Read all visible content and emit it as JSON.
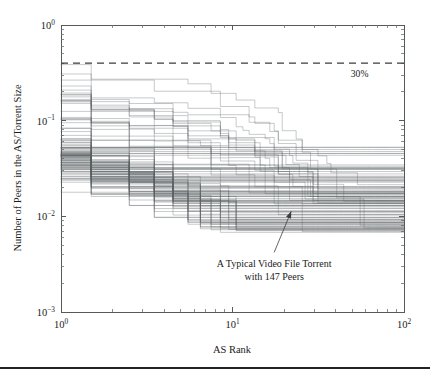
{
  "figure": {
    "title": "",
    "background_color": "#ffffff",
    "line_color": "#5d6166",
    "text_color": "#1a1a1a",
    "footer_rule": {
      "y": 367,
      "color": "#202428"
    }
  },
  "chart_data": {
    "type": "line",
    "title": "",
    "subtitle": "",
    "xlabel": "AS Rank",
    "ylabel": "Number of Peers in the AS/Torrent Size",
    "xscale": "log",
    "yscale": "log",
    "xlim": [
      1,
      100
    ],
    "ylim": [
      0.001,
      1
    ],
    "grid": false,
    "legend": "none",
    "x_tick_labels": [
      "10^0",
      "10^1",
      "10^2"
    ],
    "x_tick_values": [
      1,
      10,
      100
    ],
    "y_tick_labels": [
      "10^0",
      "10^-1",
      "10^-2",
      "10^-3"
    ],
    "y_tick_values": [
      1,
      0.1,
      0.01,
      0.001
    ],
    "annotations": [
      {
        "name": "typical-torrent-annotation",
        "text_line_1": "A Typical Video File Torrent",
        "text_line_2": "with 147 Peers",
        "arrow_from_x": 17.5,
        "arrow_from_y": 0.0042,
        "arrow_to_x": 22.0,
        "arrow_to_y": 0.0113
      },
      {
        "name": "threshold-label",
        "text": "30%",
        "x": 62,
        "y": 0.285
      }
    ],
    "reference_lines": [
      {
        "name": "thirty-percent-line",
        "orientation": "horizontal",
        "value": 0.4,
        "style": "dashed",
        "label": "30%"
      }
    ],
    "series_count": 104,
    "series_description": "Each curve is one BitTorrent torrent: fraction of that torrent's peers located in the AS ranked k, sorted in decreasing order of AS size.",
    "series_summary": {
      "x": [
        1,
        2,
        3,
        4,
        5,
        7,
        10,
        15,
        20,
        30,
        50,
        70,
        100
      ],
      "median_values": [
        0.072,
        0.05,
        0.04,
        0.033,
        0.028,
        0.022,
        0.017,
        0.0135,
        0.0118,
        0.0098,
        0.0083,
        0.0078,
        0.0075
      ],
      "upper_envelope": [
        0.4,
        0.33,
        0.3,
        0.29,
        0.28,
        0.26,
        0.21,
        0.16,
        0.1,
        0.048,
        0.026,
        0.022,
        0.021
      ],
      "lower_envelope": [
        0.03,
        0.024,
        0.02,
        0.0165,
        0.0142,
        0.0112,
        0.0087,
        0.0066,
        0.0055,
        0.0042,
        0.0028,
        0.0022,
        0.002
      ]
    },
    "series": [
      {
        "name": "torrent-high-1",
        "x": [
          1,
          3,
          5,
          8,
          12,
          20,
          35,
          60,
          100
        ],
        "values": [
          0.4,
          0.3,
          0.27,
          0.23,
          0.17,
          0.095,
          0.038,
          0.023,
          0.021
        ]
      },
      {
        "name": "torrent-high-2",
        "x": [
          1,
          4,
          7,
          11,
          18,
          30,
          55,
          100
        ],
        "values": [
          0.38,
          0.24,
          0.22,
          0.155,
          0.085,
          0.042,
          0.024,
          0.02
        ]
      },
      {
        "name": "torrent-median",
        "x": [
          1,
          2,
          4,
          8,
          15,
          30,
          60,
          100
        ],
        "values": [
          0.072,
          0.05,
          0.033,
          0.021,
          0.0135,
          0.0098,
          0.008,
          0.0075
        ]
      },
      {
        "name": "torrent-low-1",
        "x": [
          1,
          3,
          6,
          12,
          25,
          45,
          100
        ],
        "values": [
          0.03,
          0.02,
          0.0142,
          0.0095,
          0.005,
          0.003,
          0.002
        ]
      }
    ]
  },
  "plot_geometry": {
    "left": 61,
    "right": 404,
    "top": 25,
    "bottom": 312
  }
}
